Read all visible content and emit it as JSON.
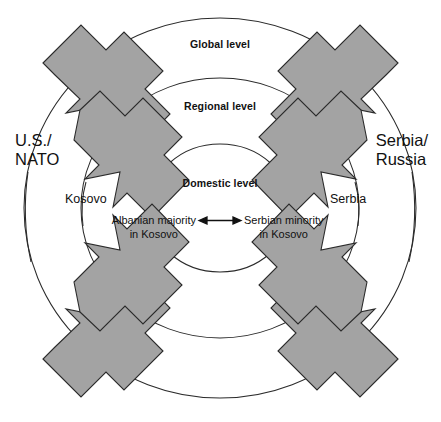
{
  "figure": {
    "background_color": "#ffffff",
    "arrow_fill_color": "#a3a3a3",
    "line_color": "#2b2b2b"
  },
  "rings": [
    {
      "id": "global",
      "label": "Global level",
      "rx": 196,
      "ry": 190
    },
    {
      "id": "regional",
      "label": "Regional level",
      "rx": 139,
      "ry": 130
    },
    {
      "id": "domestic",
      "label": "Domestic level",
      "rx": 71,
      "ry": 64
    }
  ],
  "actors": {
    "global_left": {
      "lines": [
        "U.S./",
        "NATO"
      ],
      "level": "global",
      "side": "left"
    },
    "global_right": {
      "lines": [
        "Serbia/",
        "Russia"
      ],
      "level": "global",
      "side": "right"
    },
    "regional_left": {
      "lines": [
        "Kosovo"
      ],
      "level": "regional",
      "side": "left"
    },
    "regional_right": {
      "lines": [
        "Serbia"
      ],
      "level": "regional",
      "side": "right"
    }
  },
  "domestic_parties": {
    "left": {
      "line1": "Albanian majority",
      "line2": "in Kosovo"
    },
    "right": {
      "line1": "Serbian minority",
      "line2": "in Kosovo"
    },
    "relation": "bidirectional"
  },
  "pressure_arrows": {
    "count": 8,
    "description": "Two inward-pointing block arrows in each of four diagonal quadrants",
    "quadrants": [
      "top-left",
      "top-right",
      "bottom-left",
      "bottom-right"
    ]
  }
}
